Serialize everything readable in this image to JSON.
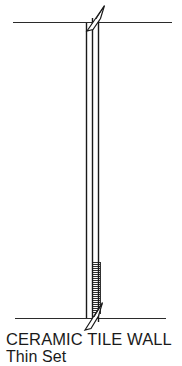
{
  "drawing": {
    "kind": "architectural-section-detail",
    "background_color": "#ffffff",
    "line_color": "#1a1a1a",
    "ceiling_line": {
      "name": "ceiling-line",
      "x1": 13,
      "y1": 22,
      "x2": 172,
      "y2": 22
    },
    "floor_line": {
      "name": "floor-line",
      "x1": 15,
      "y1": 318,
      "x2": 166,
      "y2": 318
    },
    "wall_lines": [
      {
        "name": "wall-face-line-left",
        "x1": 86,
        "y1": 22,
        "x2": 86,
        "y2": 318
      },
      {
        "name": "wall-core-line-center",
        "x1": 92,
        "y1": 18,
        "x2": 92,
        "y2": 322
      },
      {
        "name": "wall-face-line-right",
        "x1": 98,
        "y1": 18,
        "x2": 98,
        "y2": 322
      }
    ],
    "hatch": {
      "name": "thin-set-hatch",
      "x_start": 92,
      "x_end": 100,
      "y_start": 262,
      "y_end": 314,
      "line_count": 26,
      "spacing": 2
    },
    "leader_top": {
      "name": "top-break-leader",
      "direction": "up-right",
      "tip_x": 105,
      "tip_y": 6,
      "base_x": 89,
      "base_y": 30
    },
    "leader_bottom": {
      "name": "bottom-break-leader",
      "direction": "up-right",
      "tip_x": 103,
      "tip_y": 303,
      "base_x": 86,
      "base_y": 330
    }
  },
  "caption": {
    "title": "CERAMIC TILE WALL",
    "subtitle": "Thin Set"
  }
}
